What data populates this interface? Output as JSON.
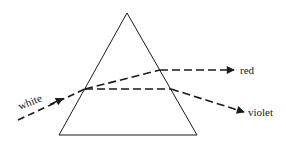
{
  "diagram": {
    "labels": {
      "incoming": "white",
      "ray_upper": "red",
      "ray_lower": "violet"
    },
    "colors": {
      "line": "#1a1a1a",
      "background": "#ffffff"
    },
    "prism": {
      "apex": [
        127,
        13
      ],
      "base_left": [
        59,
        135
      ],
      "base_right": [
        197,
        135
      ]
    },
    "rays": {
      "white": {
        "from": [
          18,
          120
        ],
        "to": [
          85,
          89
        ]
      },
      "red_inside": {
        "from": [
          85,
          89
        ],
        "to": [
          160,
          70
        ]
      },
      "red_outside": {
        "from": [
          160,
          70
        ],
        "to": [
          234,
          70
        ]
      },
      "violet_inside": {
        "from": [
          85,
          89
        ],
        "to": [
          171,
          89
        ]
      },
      "violet_outside": {
        "from": [
          171,
          89
        ],
        "to": [
          244,
          112
        ]
      }
    }
  }
}
